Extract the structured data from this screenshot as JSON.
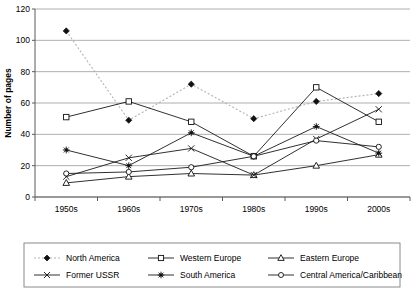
{
  "chart_data": {
    "type": "line",
    "title": "",
    "xlabel": "",
    "ylabel": "Number of pages",
    "categories": [
      "1950s",
      "1960s",
      "1970s",
      "1980s",
      "1990s",
      "2000s"
    ],
    "ylim": [
      0,
      120
    ],
    "ytick_step": 20,
    "yticks": [
      "0",
      "20",
      "40",
      "60",
      "80",
      "100",
      "120"
    ],
    "grid": "horizontal",
    "legend_position": "bottom",
    "series": [
      {
        "name": "North America",
        "marker": "filled-diamond",
        "line_style": "dotted",
        "values": [
          106,
          49,
          72,
          50,
          61,
          66
        ]
      },
      {
        "name": "Western Europe",
        "marker": "open-square",
        "line_style": "solid",
        "values": [
          51,
          61,
          48,
          26,
          70,
          48
        ]
      },
      {
        "name": "Eastern Europe",
        "marker": "open-triangle",
        "line_style": "solid",
        "values": [
          9,
          13,
          15,
          14,
          20,
          27
        ]
      },
      {
        "name": "Former USSR",
        "marker": "cross-x",
        "line_style": "solid",
        "values": [
          13,
          25,
          31,
          14,
          37,
          56
        ]
      },
      {
        "name": "South America",
        "marker": "asterisk",
        "line_style": "solid",
        "values": [
          30,
          20,
          41,
          26,
          45,
          28
        ]
      },
      {
        "name": "Central America/Caribbean",
        "marker": "open-circle",
        "line_style": "solid",
        "values": [
          15,
          16,
          19,
          26,
          36,
          32
        ]
      }
    ]
  }
}
